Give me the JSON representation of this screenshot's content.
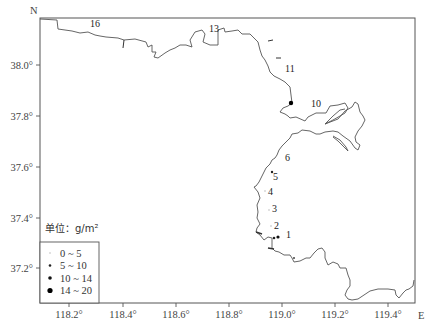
{
  "map": {
    "north_label": "N",
    "east_label": "E",
    "x_ticks": [
      {
        "label": "118.2°",
        "x": 69
      },
      {
        "label": "118.4°",
        "x": 123
      },
      {
        "label": "118.6°",
        "x": 176
      },
      {
        "label": "118.8°",
        "x": 229
      },
      {
        "label": "119.0°",
        "x": 282
      },
      {
        "label": "119.2°",
        "x": 335
      },
      {
        "label": "119.4°",
        "x": 388
      }
    ],
    "y_ticks": [
      {
        "label": "38.0°",
        "y": 65
      },
      {
        "label": "37.8°",
        "y": 116
      },
      {
        "label": "37.6°",
        "y": 167
      },
      {
        "label": "37.4°",
        "y": 218
      },
      {
        "label": "37.2°",
        "y": 268
      }
    ],
    "stations": [
      {
        "id": "1",
        "label_x": 286,
        "label_y": 238
      },
      {
        "id": "2",
        "label_x": 274,
        "label_y": 229
      },
      {
        "id": "3",
        "label_x": 272,
        "label_y": 212
      },
      {
        "id": "4",
        "label_x": 268,
        "label_y": 195
      },
      {
        "id": "5",
        "label_x": 273,
        "label_y": 180
      },
      {
        "id": "6",
        "label_x": 285,
        "label_y": 161
      },
      {
        "id": "10",
        "label_x": 311,
        "label_y": 107
      },
      {
        "id": "11",
        "label_x": 285,
        "label_y": 72
      },
      {
        "id": "13",
        "label_x": 209,
        "label_y": 32
      },
      {
        "id": "16",
        "label_x": 90,
        "label_y": 27
      }
    ],
    "legend": {
      "unit_label": "单位：g/m²",
      "items": [
        {
          "label": "0 ~ 5",
          "dot_size": 0.8,
          "color": "#bbbbbb"
        },
        {
          "label": "5 ~ 10",
          "dot_size": 1.3,
          "color": "#222222"
        },
        {
          "label": "10 ~ 14",
          "dot_size": 1.8,
          "color": "#111111"
        },
        {
          "label": "14 ~ 20",
          "dot_size": 2.6,
          "color": "#000000"
        }
      ]
    }
  }
}
